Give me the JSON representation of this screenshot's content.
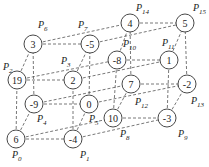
{
  "diagram": {
    "title": "",
    "radius": 9,
    "nodes": [
      {
        "id": "P0",
        "value": "6",
        "x": 16,
        "y": 139,
        "lx": 12,
        "ly": 158
      },
      {
        "id": "P1",
        "value": "-4",
        "x": 73,
        "y": 139,
        "lx": 80,
        "ly": 158
      },
      {
        "id": "P2",
        "value": "19",
        "x": 17,
        "y": 80,
        "lx": 3,
        "ly": 70
      },
      {
        "id": "P3",
        "value": "2",
        "x": 73,
        "y": 80,
        "lx": 61,
        "ly": 64
      },
      {
        "id": "P4",
        "value": "-9",
        "x": 34,
        "y": 104,
        "lx": 37,
        "ly": 122
      },
      {
        "id": "P5",
        "value": "0",
        "x": 89,
        "y": 104,
        "lx": 89,
        "ly": 122
      },
      {
        "id": "P6",
        "value": "3",
        "x": 33,
        "y": 44,
        "lx": 38,
        "ly": 28
      },
      {
        "id": "P7",
        "value": "-5",
        "x": 90,
        "y": 44,
        "lx": 78,
        "ly": 28
      },
      {
        "id": "P8",
        "value": "10",
        "x": 113,
        "y": 118,
        "lx": 120,
        "ly": 137
      },
      {
        "id": "P9",
        "value": "-3",
        "x": 167,
        "y": 118,
        "lx": 178,
        "ly": 137
      },
      {
        "id": "P10",
        "value": "-8",
        "x": 117,
        "y": 60,
        "lx": 123,
        "ly": 47
      },
      {
        "id": "P11",
        "value": "1",
        "x": 169,
        "y": 60,
        "lx": 162,
        "ly": 46
      },
      {
        "id": "P12",
        "value": "7",
        "x": 131,
        "y": 84,
        "lx": 135,
        "ly": 105
      },
      {
        "id": "P13",
        "value": "-2",
        "x": 187,
        "y": 84,
        "lx": 191,
        "ly": 104
      },
      {
        "id": "P14",
        "value": "4",
        "x": 130,
        "y": 23,
        "lx": 136,
        "ly": 11
      },
      {
        "id": "P15",
        "value": "5",
        "x": 185,
        "y": 23,
        "lx": 193,
        "ly": 11
      }
    ],
    "edges": [
      [
        "P0",
        "P1"
      ],
      [
        "P0",
        "P2"
      ],
      [
        "P0",
        "P4"
      ],
      [
        "P0",
        "P8"
      ],
      [
        "P1",
        "P3"
      ],
      [
        "P1",
        "P5"
      ],
      [
        "P1",
        "P9"
      ],
      [
        "P2",
        "P3"
      ],
      [
        "P2",
        "P6"
      ],
      [
        "P2",
        "P10"
      ],
      [
        "P3",
        "P7"
      ],
      [
        "P3",
        "P11"
      ],
      [
        "P4",
        "P5"
      ],
      [
        "P4",
        "P6"
      ],
      [
        "P4",
        "P12"
      ],
      [
        "P5",
        "P7"
      ],
      [
        "P5",
        "P13"
      ],
      [
        "P6",
        "P7"
      ],
      [
        "P6",
        "P14"
      ],
      [
        "P7",
        "P15"
      ],
      [
        "P8",
        "P9"
      ],
      [
        "P8",
        "P10"
      ],
      [
        "P8",
        "P12"
      ],
      [
        "P9",
        "P11"
      ],
      [
        "P9",
        "P13"
      ],
      [
        "P10",
        "P11"
      ],
      [
        "P10",
        "P14"
      ],
      [
        "P11",
        "P15"
      ],
      [
        "P12",
        "P13"
      ],
      [
        "P12",
        "P14"
      ],
      [
        "P13",
        "P15"
      ],
      [
        "P14",
        "P15"
      ]
    ]
  }
}
